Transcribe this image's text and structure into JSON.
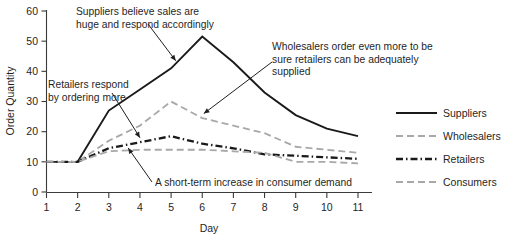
{
  "chart_data": {
    "type": "line",
    "title": "",
    "xlabel": "Day",
    "ylabel": "Order Quantity",
    "x": [
      1,
      2,
      3,
      4,
      5,
      6,
      7,
      8,
      9,
      10,
      11
    ],
    "categories": [
      "1",
      "2",
      "3",
      "4",
      "5",
      "6",
      "7",
      "8",
      "9",
      "10",
      "11"
    ],
    "xlim": [
      1,
      11
    ],
    "ylim": [
      0,
      60
    ],
    "yticks": [
      0,
      10,
      20,
      30,
      40,
      50,
      60
    ],
    "ytick_labels": [
      "0",
      "10",
      "20",
      "30",
      "40",
      "50",
      "60"
    ],
    "xticks": [
      1,
      2,
      3,
      4,
      5,
      6,
      7,
      8,
      9,
      10,
      11
    ],
    "xtick_labels": [
      "1",
      "2",
      "3",
      "4",
      "5",
      "6",
      "7",
      "8",
      "9",
      "10",
      "11"
    ],
    "grid": false,
    "legend_position": "right",
    "series": [
      {
        "name": "Suppliers",
        "color": "#1a1a1a",
        "style": "solid",
        "values": [
          10,
          10,
          27,
          34,
          41,
          51.5,
          43,
          33,
          25.5,
          21,
          18.5
        ]
      },
      {
        "name": "Wholesalers",
        "color": "#a8a8a8",
        "style": "dashed",
        "values": [
          10,
          10,
          17,
          22,
          30,
          24.5,
          22,
          19.5,
          15,
          14,
          13
        ]
      },
      {
        "name": "Retailers",
        "color": "#1a1a1a",
        "style": "dashdot",
        "values": [
          10,
          10,
          14.5,
          16.5,
          18.5,
          16,
          14.5,
          12.5,
          12,
          11.5,
          11
        ]
      },
      {
        "name": "Consumers",
        "color": "#a8a8a8",
        "style": "dashed",
        "values": [
          10,
          10,
          13.5,
          14,
          14,
          14,
          13.5,
          13,
          10,
          10,
          9.5
        ]
      }
    ],
    "annotations": [
      {
        "id": "suppliers-note",
        "lines": [
          "Suppliers believe sales are",
          "huge and respond accordingly"
        ],
        "points_to": {
          "day": 5.2,
          "value": 43
        }
      },
      {
        "id": "wholesalers-note",
        "lines": [
          "Wholesalers order even more to be",
          "sure retailers can be adequately",
          "supplied"
        ],
        "points_to": {
          "day": 6,
          "value": 24.5
        }
      },
      {
        "id": "retailers-note",
        "lines": [
          "Retailers respond",
          "by ordering more"
        ],
        "points_to": {
          "day": 4,
          "value": 16.5
        }
      },
      {
        "id": "consumers-note",
        "lines": [
          "A short-term increase in consumer demand"
        ],
        "points_to": {
          "day": 3.6,
          "value": 13.8
        }
      }
    ]
  },
  "legend": {
    "items": [
      {
        "label": "Suppliers"
      },
      {
        "label": "Wholesalers"
      },
      {
        "label": "Retailers"
      },
      {
        "label": "Consumers"
      }
    ]
  },
  "axes": {
    "y_title": "Order Quantity",
    "x_title": "Day"
  }
}
